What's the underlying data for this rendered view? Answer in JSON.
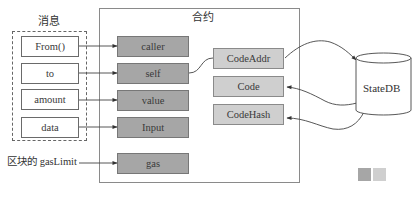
{
  "message": {
    "title": "消息",
    "fields": [
      "From()",
      "to",
      "amount",
      "data"
    ]
  },
  "block_gas_label": "区块的 gasLimit",
  "contract": {
    "title": "合约",
    "fields": [
      "caller",
      "self",
      "value",
      "Input",
      "gas"
    ],
    "code_fields": [
      "CodeAddr",
      "Code",
      "CodeHash"
    ]
  },
  "statedb": {
    "label": "StateDB"
  },
  "legend": {
    "swatches": [
      {
        "name": "dark-swatch",
        "color": "#a6a6a6"
      },
      {
        "name": "light-swatch",
        "color": "#cfcfcf"
      }
    ]
  },
  "colors": {
    "dark_box": "#a6a6a6",
    "light_box": "#cfcfcf",
    "line": "#444444",
    "background": "#ffffff"
  }
}
